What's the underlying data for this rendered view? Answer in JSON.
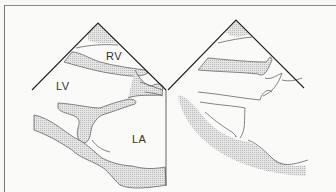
{
  "figure": {
    "left_panel": {
      "labels": {
        "rv": "RV",
        "lv": "LV",
        "la": "LA"
      }
    },
    "right_panel": {
      "labels": {}
    }
  },
  "colors": {
    "line": "#555555",
    "sector_edge": "#222222",
    "stipple": "#c9c9c9",
    "background": "#fafaf8"
  }
}
